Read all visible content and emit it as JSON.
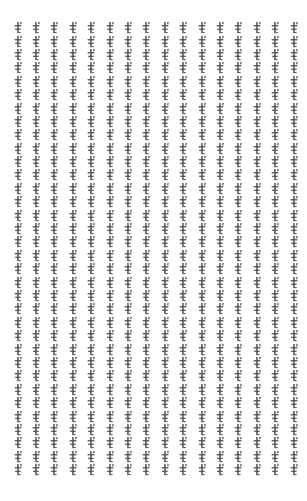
{
  "page": {
    "width": 307,
    "height": 501,
    "background_color": "#ffffff"
  },
  "glyph": {
    "name": "dagger-glyph",
    "character": "ŧ",
    "color": "#3a3a3a",
    "repeat_count": 544
  },
  "grid": {
    "columns": 16,
    "rows": 34,
    "column_pitch_px": 18.4,
    "row_pitch_px": 13.4,
    "margin_left_px": 15,
    "margin_top_px": 27,
    "margin_right_px": 13,
    "margin_bottom_px": 20
  }
}
